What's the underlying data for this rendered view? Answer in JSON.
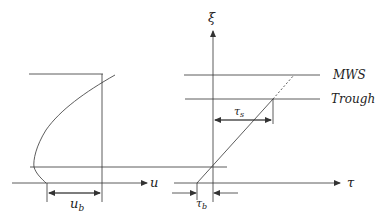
{
  "left_panel": {
    "axis_label": "u",
    "bed_velocity_label": "u",
    "bed_velocity_subscript": "b"
  },
  "right_panel": {
    "vertical_axis_label": "ξ",
    "horizontal_axis_label": "τ",
    "level_labels": [
      "MWS",
      "Trough"
    ],
    "surface_stress_label": "τ",
    "surface_stress_subscript": "s",
    "bed_stress_label": "τ",
    "bed_stress_subscript": "b"
  },
  "colors": {
    "line": "#333333",
    "text": "#222222",
    "background": "#ffffff"
  }
}
